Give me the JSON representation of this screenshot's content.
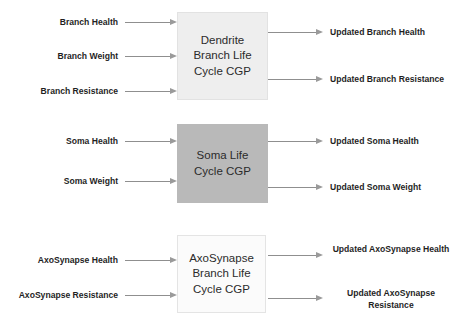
{
  "diagram": {
    "type": "block-diagram",
    "title": "",
    "accent_colors": {
      "box_dendrite_fill": "#eeeeee",
      "box_soma_fill": "#b9b9b9",
      "box_axosynapse_fill": "#fbfbfb",
      "arrow_color": "#8f8f8f",
      "label_color": "#1f1f1f",
      "background": "#ffffff"
    },
    "blocks": [
      {
        "id": "dendrite",
        "lines": [
          "Dendrite",
          "Branch Life",
          "Cycle CGP"
        ],
        "inputs": [
          "Branch Health",
          "Branch Weight",
          "Branch Resistance"
        ],
        "outputs": [
          "Updated Branch Health",
          "Updated Branch Resistance"
        ]
      },
      {
        "id": "soma",
        "lines": [
          "Soma Life",
          "Cycle CGP"
        ],
        "inputs": [
          "Soma Health",
          "Soma Weight"
        ],
        "outputs": [
          "Updated Soma Health",
          "Updated Soma Weight"
        ]
      },
      {
        "id": "axosynapse",
        "lines": [
          "AxoSynapse",
          "Branch Life",
          "Cycle CGP"
        ],
        "inputs": [
          "AxoSynapse Health",
          "AxoSynapse Resistance"
        ],
        "outputs": [
          "Updated AxoSynapse Health",
          "Updated AxoSynapse Resistance"
        ]
      }
    ]
  }
}
